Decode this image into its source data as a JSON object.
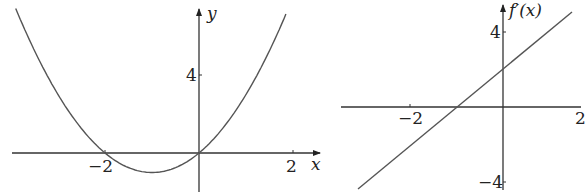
{
  "chart_data": [
    {
      "type": "line",
      "title": "",
      "function": "f(x) = x^2 + 2x",
      "xlabel": "x",
      "ylabel": "y",
      "x_ticks": [
        -2,
        2
      ],
      "y_ticks": [
        4
      ],
      "xlim": [
        -4.1,
        2.6
      ],
      "ylim": [
        -2.4,
        7.5
      ],
      "grid": false,
      "key_points": [
        {
          "x": -2,
          "y": 0
        },
        {
          "x": -1,
          "y": -1
        },
        {
          "x": 0,
          "y": 0
        }
      ],
      "x": [
        -3.9,
        -3,
        -2,
        -1,
        0,
        1,
        1.85
      ],
      "values": [
        7.41,
        3,
        0,
        -1,
        0,
        3,
        7.12
      ]
    },
    {
      "type": "line",
      "title": "",
      "function": "f'(x) = 2x + 2",
      "xlabel": "",
      "ylabel": "f'(x)",
      "x_ticks": [
        -2,
        2
      ],
      "y_ticks": [
        4,
        -4
      ],
      "xlim": [
        -3.8,
        2.3
      ],
      "ylim": [
        -4.5,
        5.5
      ],
      "grid": false,
      "key_points": [
        {
          "x": -1,
          "y": 0
        },
        {
          "x": 0,
          "y": 2
        }
      ],
      "x": [
        -3.2,
        2.2
      ],
      "values": [
        -4.4,
        6.4
      ]
    }
  ],
  "left": {
    "x_label": "x",
    "y_label": "y",
    "tick_x_neg": "−2",
    "tick_x_pos": "2",
    "tick_y": "4"
  },
  "right": {
    "y_label": "f′(x)",
    "tick_x_neg": "−2",
    "tick_x_pos": "2",
    "tick_y_pos": "4",
    "tick_y_neg": "−4"
  }
}
